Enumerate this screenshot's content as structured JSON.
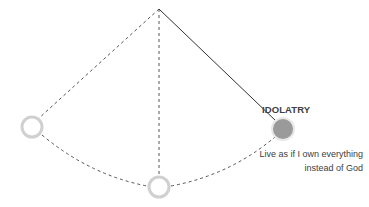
{
  "diagram": {
    "type": "pendulum",
    "pivot": {
      "x": 159,
      "y": 9
    },
    "positions": [
      {
        "id": "left",
        "x": 32,
        "y": 127,
        "state": "empty"
      },
      {
        "id": "center",
        "x": 159,
        "y": 187,
        "state": "empty"
      },
      {
        "id": "right",
        "x": 283,
        "y": 129,
        "state": "filled",
        "fill": "#9a9a9a"
      }
    ],
    "active_label": {
      "title": "IDOLATRY",
      "description": "Live as if I own everything instead of God"
    },
    "colors": {
      "line": "#333333",
      "dashed": "#555555",
      "circle_stroke": "#d0d0d0",
      "text": "#404040"
    }
  }
}
